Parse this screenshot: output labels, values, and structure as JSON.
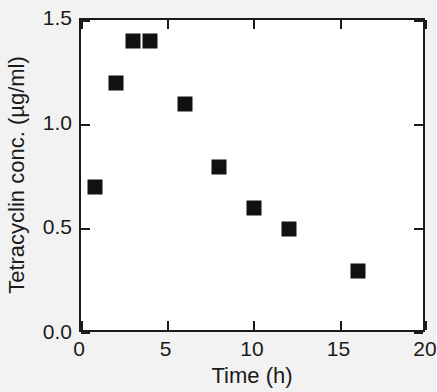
{
  "chart_data": {
    "type": "scatter",
    "title": "",
    "xlabel": "Time (h)",
    "ylabel": "Tetracyclin conc. (µg/ml)",
    "xlim": [
      0,
      20
    ],
    "ylim": [
      0.0,
      1.5
    ],
    "xticks": [
      0,
      5,
      10,
      15,
      20
    ],
    "xtick_labels": [
      "0",
      "5",
      "10",
      "15",
      "20"
    ],
    "yticks": [
      0.0,
      0.5,
      1.0,
      1.5
    ],
    "ytick_labels": [
      "0.0",
      "0.5",
      "1.0",
      "1.5"
    ],
    "grid": false,
    "legend": null,
    "marker": "filled-square",
    "marker_color": "#111111",
    "x": [
      0.8,
      2,
      3,
      4,
      6,
      8,
      10,
      12,
      16
    ],
    "y": [
      0.7,
      1.2,
      1.4,
      1.4,
      1.1,
      0.8,
      0.6,
      0.5,
      0.3
    ],
    "points": [
      {
        "x": 0.8,
        "y": 0.7
      },
      {
        "x": 2,
        "y": 1.2
      },
      {
        "x": 3,
        "y": 1.4
      },
      {
        "x": 4,
        "y": 1.4
      },
      {
        "x": 6,
        "y": 1.1
      },
      {
        "x": 8,
        "y": 0.8
      },
      {
        "x": 10,
        "y": 0.6
      },
      {
        "x": 12,
        "y": 0.5
      },
      {
        "x": 16,
        "y": 0.3
      }
    ]
  }
}
